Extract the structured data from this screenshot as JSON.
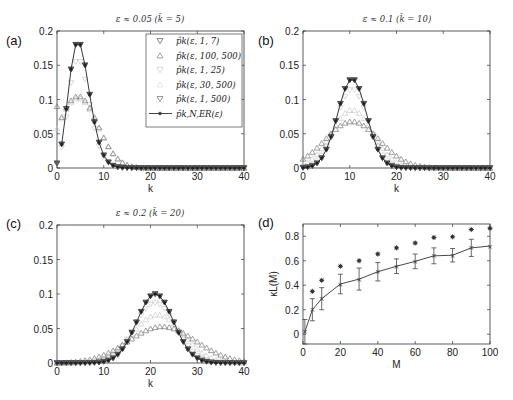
{
  "figure": {
    "panels": [
      {
        "id": "a",
        "label": "(a)",
        "title": "ε ≈ 0.05 (k̄ = 5)"
      },
      {
        "id": "b",
        "label": "(b)",
        "title": "ε ≈ 0.1 (k̄ = 10)"
      },
      {
        "id": "c",
        "label": "(c)",
        "title": "ε ≈ 0.2 (k̄ = 20)"
      },
      {
        "id": "d",
        "label": "(d)",
        "title": ""
      }
    ],
    "legend": [
      {
        "label": "p̂k(ε, 1, 7)",
        "marker": "triangle-down",
        "color": "#555555"
      },
      {
        "label": "p̂k(ε, 100, 500)",
        "marker": "triangle-up",
        "color": "#777777"
      },
      {
        "label": "p̂k(ε, 1, 25)",
        "marker": "triangle-down",
        "color": "#cccccc"
      },
      {
        "label": "p̂k(ε, 30, 500)",
        "marker": "triangle-up",
        "color": "#dddddd"
      },
      {
        "label": "p̂k(ε, 1, 500)",
        "marker": "triangle-down",
        "color": "#666666"
      },
      {
        "label": "p̂k,N,ER(ε)",
        "marker": "star-line",
        "color": "#333333"
      }
    ]
  },
  "chart_data": [
    {
      "panel": "a",
      "type": "line",
      "title": "ε ≈ 0.05 (k̄ = 5)",
      "xlabel": "k",
      "ylabel": "",
      "xlim": [
        0,
        40
      ],
      "ylim": [
        0,
        0.2
      ],
      "xticks": [
        0,
        10,
        20,
        30,
        40
      ],
      "yticks": [
        0,
        0.05,
        0.1,
        0.15,
        0.2
      ],
      "xtick_labels": [
        "0",
        "10",
        "20",
        "30",
        "40"
      ],
      "ytick_labels": [
        "0",
        "0.05",
        "0.1",
        "0.15",
        "0.2"
      ],
      "legend_position": "upper right",
      "series": [
        {
          "name": "p̂k,N,ER(ε)",
          "mean": 5,
          "kind": "poisson",
          "peak": 0.18
        },
        {
          "name": "p̂k(ε, 1, 7)",
          "mean": 5,
          "kind": "poisson",
          "peak": 0.18
        },
        {
          "name": "p̂k(ε, 1, 500)",
          "mean": 5,
          "kind": "poisson",
          "peak": 0.18
        },
        {
          "name": "p̂k(ε, 1, 25)",
          "mean": 5,
          "kind": "poisson",
          "peak": 0.155
        },
        {
          "name": "p̂k(ε, 30, 500)",
          "mean": 4.5,
          "kind": "broad",
          "peak": 0.102,
          "sd": 4.2,
          "y0": 0.05
        },
        {
          "name": "p̂k(ε, 100, 500)",
          "mean": 4.5,
          "kind": "broad",
          "peak": 0.105,
          "sd": 4.2,
          "y0": 0.09
        }
      ]
    },
    {
      "panel": "b",
      "type": "line",
      "title": "ε ≈ 0.1 (k̄ = 10)",
      "xlabel": "k",
      "ylabel": "",
      "xlim": [
        0,
        40
      ],
      "ylim": [
        0,
        0.2
      ],
      "xticks": [
        0,
        10,
        20,
        30,
        40
      ],
      "yticks": [
        0,
        0.05,
        0.1,
        0.15,
        0.2
      ],
      "xtick_labels": [
        "0",
        "10",
        "20",
        "30",
        "40"
      ],
      "ytick_labels": [
        "0",
        "0.05",
        "0.1",
        "0.15",
        "0.2"
      ],
      "series": [
        {
          "name": "p̂k,N,ER(ε)",
          "mean": 10.5,
          "kind": "gauss",
          "peak": 0.13,
          "sd": 3.1
        },
        {
          "name": "p̂k(ε, 1, 7)",
          "mean": 10.5,
          "kind": "gauss",
          "peak": 0.13,
          "sd": 3.1
        },
        {
          "name": "p̂k(ε, 1, 500)",
          "mean": 10.5,
          "kind": "gauss",
          "peak": 0.13,
          "sd": 3.1
        },
        {
          "name": "p̂k(ε, 1, 25)",
          "mean": 10.5,
          "kind": "gauss",
          "peak": 0.115,
          "sd": 3.4
        },
        {
          "name": "p̂k(ε, 30, 500)",
          "mean": 10.5,
          "kind": "gauss",
          "peak": 0.085,
          "sd": 4.4
        },
        {
          "name": "p̂k(ε, 100, 500)",
          "mean": 10.5,
          "kind": "gauss",
          "peak": 0.068,
          "sd": 5.8
        }
      ]
    },
    {
      "panel": "c",
      "type": "line",
      "title": "ε ≈ 0.2 (k̄ = 20)",
      "xlabel": "k",
      "ylabel": "",
      "xlim": [
        0,
        40
      ],
      "ylim": [
        0,
        0.2
      ],
      "xticks": [
        0,
        10,
        20,
        30,
        40
      ],
      "yticks": [
        0,
        0.05,
        0.1,
        0.15,
        0.2
      ],
      "xtick_labels": [
        "0",
        "10",
        "20",
        "30",
        "40"
      ],
      "ytick_labels": [
        "0",
        "0.05",
        "0.1",
        "0.15",
        "0.2"
      ],
      "series": [
        {
          "name": "p̂k,N,ER(ε)",
          "mean": 21,
          "kind": "gauss",
          "peak": 0.1,
          "sd": 3.9
        },
        {
          "name": "p̂k(ε, 1, 7)",
          "mean": 21,
          "kind": "gauss",
          "peak": 0.1,
          "sd": 3.9
        },
        {
          "name": "p̂k(ε, 1, 500)",
          "mean": 21,
          "kind": "gauss",
          "peak": 0.1,
          "sd": 3.9
        },
        {
          "name": "p̂k(ε, 1, 25)",
          "mean": 21,
          "kind": "gauss",
          "peak": 0.087,
          "sd": 4.4
        },
        {
          "name": "p̂k(ε, 30, 500)",
          "mean": 21.5,
          "kind": "gauss",
          "peak": 0.07,
          "sd": 5.4
        },
        {
          "name": "p̂k(ε, 100, 500)",
          "mean": 22.5,
          "kind": "gauss",
          "peak": 0.053,
          "sd": 7.2
        }
      ]
    },
    {
      "panel": "d",
      "type": "line",
      "title": "",
      "xlabel": "M",
      "ylabel": "κL(M)",
      "xlim": [
        0,
        100
      ],
      "ylim": [
        -0.08,
        0.9
      ],
      "xticks": [
        0,
        20,
        40,
        60,
        80,
        100
      ],
      "yticks": [
        0,
        0.2,
        0.4,
        0.6,
        0.8
      ],
      "xtick_labels": [
        "0",
        "20",
        "40",
        "60",
        "80",
        "100"
      ],
      "ytick_labels": [
        "0",
        "0.2",
        "0.4",
        "0.6",
        "0.8"
      ],
      "series": [
        {
          "name": "mean with error bars",
          "x": [
            1,
            5,
            10,
            20,
            30,
            40,
            50,
            60,
            70,
            80,
            90,
            100
          ],
          "y": [
            0.02,
            0.2,
            0.29,
            0.41,
            0.45,
            0.51,
            0.555,
            0.595,
            0.64,
            0.645,
            0.705,
            0.72
          ],
          "err": [
            0.1,
            0.09,
            0.09,
            0.08,
            0.09,
            0.075,
            0.06,
            0.06,
            0.065,
            0.055,
            0.07,
            0.0
          ]
        },
        {
          "name": "stars",
          "x": [
            5,
            10,
            20,
            30,
            40,
            50,
            60,
            70,
            80,
            90,
            100
          ],
          "y": [
            0.35,
            0.44,
            0.555,
            0.6,
            0.655,
            0.705,
            0.745,
            0.79,
            0.795,
            0.855,
            0.865
          ]
        }
      ]
    }
  ]
}
